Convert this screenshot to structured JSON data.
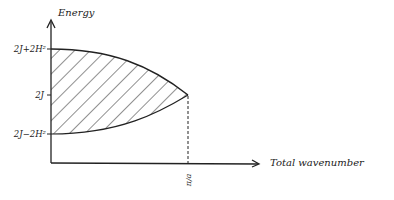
{
  "diagram": {
    "y_axis_label": "Energy",
    "x_axis_label": "Total wavenumber",
    "y_ticks": [
      "2J+2H²",
      "2J",
      "2J−2H²"
    ],
    "x_ticks": [
      "π/a"
    ],
    "ink_color": "#222222",
    "background": "#ffffff"
  }
}
